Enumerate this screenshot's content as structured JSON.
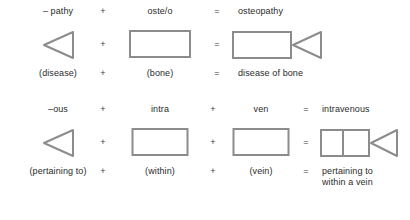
{
  "diagram": {
    "line_color": "#8c8c8c",
    "text_color": "#2b2b2b",
    "background": "#ffffff",
    "blocks": [
      {
        "id": "osteopathy",
        "terms": [
          "– pathy",
          "oste/o",
          "osteopathy"
        ],
        "operators": [
          "+",
          "="
        ],
        "meanings": [
          "(disease)",
          "(bone)",
          "disease of bone"
        ],
        "shapes": [
          {
            "kind": "triangle-left"
          },
          {
            "kind": "rectangle"
          },
          {
            "kind": "rectangle-plus-triangle"
          }
        ]
      },
      {
        "id": "intravenous",
        "terms": [
          "–ous",
          "intra",
          "ven",
          "intravenous"
        ],
        "operators": [
          "+",
          "+",
          "="
        ],
        "meanings": [
          "(pertaining to)",
          "(within)",
          "(vein)",
          "pertaining to\nwithin a vein"
        ],
        "meaning_result_line1": "pertaining to",
        "meaning_result_line2": "within a vein",
        "shapes": [
          {
            "kind": "triangle-left"
          },
          {
            "kind": "rectangle"
          },
          {
            "kind": "rectangle"
          },
          {
            "kind": "two-rectangles-plus-triangle"
          }
        ]
      }
    ]
  }
}
